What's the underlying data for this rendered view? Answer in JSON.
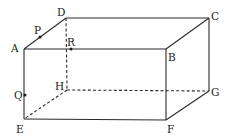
{
  "diagram": {
    "type": "cuboid",
    "vertices": {
      "A": {
        "x": 24,
        "y": 49,
        "label": "A"
      },
      "B": {
        "x": 166,
        "y": 49,
        "label": "B"
      },
      "C": {
        "x": 209,
        "y": 18,
        "label": "C"
      },
      "D": {
        "x": 66,
        "y": 18,
        "label": "D"
      },
      "E": {
        "x": 24,
        "y": 119,
        "label": "E"
      },
      "F": {
        "x": 166,
        "y": 120,
        "label": "F"
      },
      "G": {
        "x": 209,
        "y": 91,
        "label": "G"
      },
      "H": {
        "x": 67,
        "y": 90,
        "label": "H"
      }
    },
    "points": {
      "P": {
        "x": 40,
        "y": 37,
        "label": "P",
        "on_edge": "AD"
      },
      "R": {
        "x": 71,
        "y": 49,
        "label": "R",
        "on_edge": "AB"
      },
      "Q": {
        "x": 25,
        "y": 95,
        "label": "Q",
        "on_edge": "AE"
      }
    },
    "visible_edges": [
      "AB",
      "BC",
      "CD",
      "DA",
      "AE",
      "EF",
      "FG",
      "GC",
      "BF"
    ],
    "hidden_edges": [
      "DH",
      "HE",
      "HG"
    ],
    "colors": {
      "line": "#2a2a2a",
      "label": "#1a1a1a",
      "background": "#ffffff"
    }
  }
}
